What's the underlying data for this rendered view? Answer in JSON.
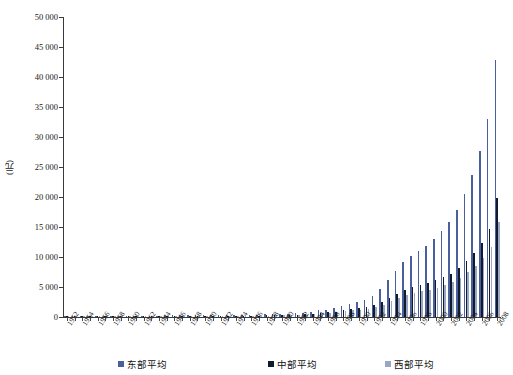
{
  "chart_data": {
    "type": "bar",
    "title": "",
    "subtitle": "",
    "xlabel": "",
    "ylabel": "(元)",
    "ylim": [
      0,
      50000
    ],
    "ytick_values": [
      0,
      5000,
      10000,
      15000,
      20000,
      25000,
      30000,
      35000,
      40000,
      45000,
      50000
    ],
    "ytick_labels": [
      "0",
      "5 000",
      "10 000",
      "15 000",
      "20 000",
      "25 000",
      "30 000",
      "35 000",
      "40 000",
      "45 000",
      "50 000"
    ],
    "grid": false,
    "legend_position": "bottom",
    "x": [
      1952,
      1953,
      1954,
      1955,
      1956,
      1957,
      1958,
      1959,
      1960,
      1961,
      1962,
      1963,
      1964,
      1965,
      1966,
      1967,
      1968,
      1969,
      1970,
      1971,
      1972,
      1973,
      1974,
      1975,
      1976,
      1977,
      1978,
      1979,
      1980,
      1981,
      1982,
      1983,
      1984,
      1985,
      1986,
      1987,
      1988,
      1989,
      1990,
      1991,
      1992,
      1993,
      1994,
      1995,
      1996,
      1997,
      1998,
      1999,
      2000,
      2001,
      2002,
      2003,
      2004,
      2005,
      2006,
      2007,
      2008
    ],
    "xtick_labels": [
      "1952",
      "1954",
      "1956",
      "1958",
      "1960",
      "1962",
      "1964",
      "1966",
      "1968",
      "1970",
      "1972",
      "1974",
      "1976",
      "1978",
      "1980",
      "1982",
      "1984",
      "1986",
      "1988",
      "1990",
      "1992",
      "1994",
      "1996",
      "1998",
      "2000",
      "2002",
      "2004",
      "2006",
      "2008"
    ],
    "xtick_interval": 2,
    "series": [
      {
        "name": "东部平均",
        "color": "#4a5f9e",
        "values": [
          130,
          140,
          150,
          155,
          175,
          180,
          215,
          230,
          240,
          200,
          195,
          205,
          230,
          255,
          275,
          265,
          260,
          275,
          305,
          315,
          325,
          340,
          345,
          360,
          355,
          375,
          425,
          480,
          545,
          585,
          640,
          720,
          880,
          1090,
          1250,
          1500,
          1900,
          2200,
          2450,
          2900,
          3550,
          4600,
          6100,
          7700,
          9100,
          10200,
          11000,
          11900,
          13000,
          14300,
          15800,
          17800,
          20500,
          23600,
          27600,
          33000,
          42800
        ]
      },
      {
        "name": "中部平均",
        "color": "#121a2e",
        "values": [
          105,
          110,
          118,
          122,
          135,
          140,
          160,
          170,
          168,
          140,
          135,
          142,
          158,
          172,
          185,
          180,
          178,
          188,
          205,
          212,
          218,
          228,
          232,
          240,
          238,
          250,
          280,
          318,
          355,
          378,
          412,
          462,
          560,
          680,
          770,
          905,
          1130,
          1300,
          1420,
          1630,
          1960,
          2450,
          3150,
          3900,
          4550,
          5000,
          5300,
          5650,
          6100,
          6650,
          7250,
          8100,
          9350,
          10700,
          12400,
          14600,
          19900
        ]
      },
      {
        "name": "西部平均",
        "color": "#9aa7c4",
        "values": [
          95,
          100,
          107,
          110,
          122,
          126,
          146,
          156,
          152,
          126,
          120,
          128,
          142,
          155,
          166,
          162,
          160,
          168,
          184,
          190,
          196,
          204,
          208,
          214,
          212,
          222,
          248,
          282,
          315,
          334,
          362,
          406,
          490,
          596,
          672,
          790,
          980,
          1120,
          1215,
          1390,
          1670,
          2060,
          2620,
          3210,
          3720,
          4070,
          4290,
          4550,
          4880,
          5300,
          5780,
          6450,
          7420,
          8500,
          9850,
          11600,
          15900
        ]
      }
    ]
  },
  "legend": {
    "items": [
      {
        "label": "东部平均",
        "color": "#4a5f9e"
      },
      {
        "label": "中部平均",
        "color": "#121a2e"
      },
      {
        "label": "西部平均",
        "color": "#9aa7c4"
      }
    ]
  }
}
